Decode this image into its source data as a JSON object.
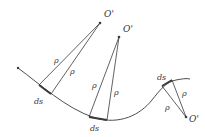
{
  "diagram": {
    "title": "",
    "colors": {
      "line": "#3a3a3a",
      "text": "#333333"
    },
    "labels": {
      "center_1": "O'",
      "center_2": "O'",
      "center_3": "O'",
      "rho_1a": "ρ",
      "rho_1b": "ρ",
      "rho_2a": "ρ",
      "rho_2b": "ρ",
      "rho_3a": "ρ",
      "rho_3b": "ρ",
      "ds_1": "ds",
      "ds_2": "ds",
      "ds_3": "ds"
    }
  }
}
